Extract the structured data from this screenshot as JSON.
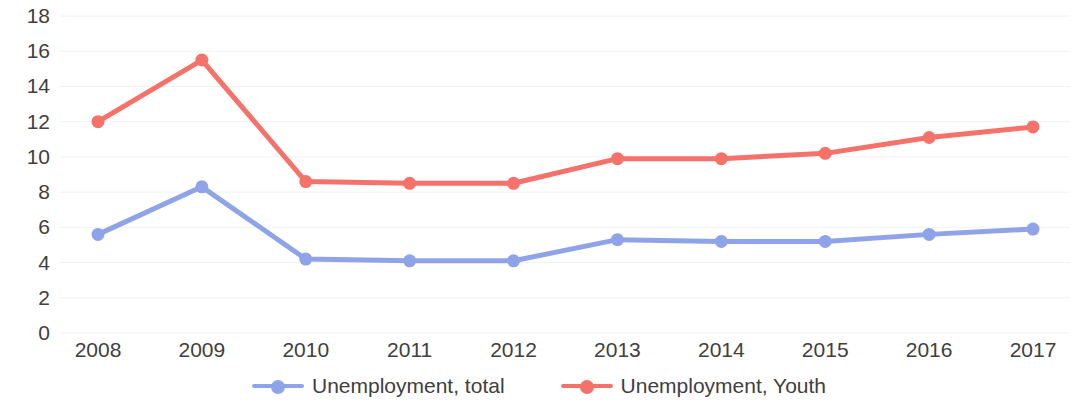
{
  "chart_data": {
    "type": "line",
    "title": "",
    "subtitle": "",
    "xlabel": "",
    "ylabel": "",
    "categories": [
      "2008",
      "2009",
      "2010",
      "2011",
      "2012",
      "2013",
      "2014",
      "2015",
      "2016",
      "2017"
    ],
    "series": [
      {
        "name": "Unemployment, total",
        "color": "#8FA4E8",
        "values": [
          5.6,
          8.3,
          4.2,
          4.1,
          4.1,
          5.3,
          5.2,
          5.2,
          5.6,
          5.9
        ]
      },
      {
        "name": "Unemployment, Youth",
        "color": "#F4726A",
        "values": [
          12.0,
          15.5,
          8.6,
          8.5,
          8.5,
          9.9,
          9.9,
          10.2,
          11.1,
          11.7
        ]
      }
    ],
    "ylim": [
      0,
      18
    ],
    "ytick_step": 2,
    "ytick_labels": [
      "18",
      "16",
      "14",
      "12",
      "10",
      "8",
      "6",
      "4",
      "2",
      "0"
    ],
    "grid": true,
    "grid_color": "#f2f2f2",
    "legend_position": "bottom",
    "marker": "circle"
  },
  "legend": {
    "items": [
      {
        "label": "Unemployment, total",
        "color": "#8FA4E8"
      },
      {
        "label": "Unemployment, Youth",
        "color": "#F4726A"
      }
    ]
  }
}
